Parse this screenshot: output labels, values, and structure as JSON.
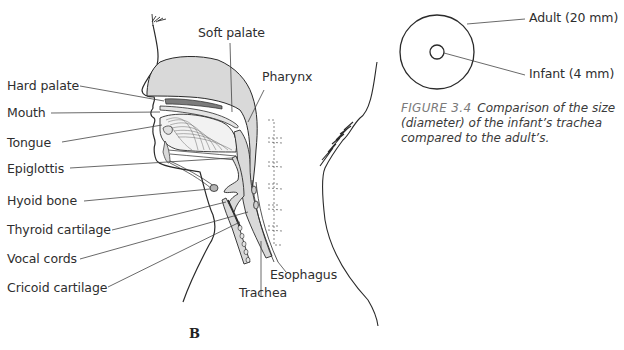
{
  "diagram": {
    "panel_letter": "B",
    "anatomy_labels": {
      "left": [
        {
          "key": "hard_palate",
          "text": "Hard palate"
        },
        {
          "key": "mouth",
          "text": "Mouth"
        },
        {
          "key": "tongue",
          "text": "Tongue"
        },
        {
          "key": "epiglottis",
          "text": "Epiglottis"
        },
        {
          "key": "hyoid_bone",
          "text": "Hyoid bone"
        },
        {
          "key": "thyroid_cartilage",
          "text": "Thyroid cartilage"
        },
        {
          "key": "vocal_cords",
          "text": "Vocal cords"
        },
        {
          "key": "cricoid_cartilage",
          "text": "Cricoid cartilage"
        }
      ],
      "top": [
        {
          "key": "soft_palate",
          "text": "Soft palate"
        },
        {
          "key": "pharynx",
          "text": "Pharynx"
        }
      ],
      "bottom": [
        {
          "key": "esophagus",
          "text": "Esophagus"
        },
        {
          "key": "trachea",
          "text": "Trachea"
        }
      ]
    },
    "colors": {
      "tissue_fill": "#d9d9d9",
      "tissue_dark": "#8c8c8c",
      "outline": "#2a2a2a",
      "leader_line": "#444444"
    }
  },
  "trachea_comparison": {
    "adult_label": "Adult (20 mm)",
    "infant_label": "Infant (4 mm)",
    "adult_diameter_mm": 20,
    "infant_diameter_mm": 4
  },
  "caption": {
    "figure_number": "FIGURE 3.4",
    "text": "Comparison of the size (diameter) of the infant’s trachea compared to the adult’s."
  }
}
